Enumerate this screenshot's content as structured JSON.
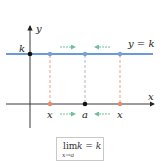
{
  "diagram": {
    "axes": {
      "x_label": "x",
      "y_label": "y"
    },
    "line": {
      "label": "y = k",
      "color": "#6a9bd8"
    },
    "k_label": "k",
    "x_axis_labels": {
      "left_x": "x",
      "center_a": "a",
      "right_x": "x"
    },
    "formula": {
      "lim": "lim",
      "subscript": "x→a",
      "expression": "k = k"
    },
    "colors": {
      "horizontal_line": "#6a9bd8",
      "dashed": "#e8886a",
      "arrow": "#6fbf9a",
      "point_blue": "#7aa0d8",
      "point_orange": "#e88a6a",
      "point_black": "#111111",
      "axis": "#222222"
    }
  }
}
